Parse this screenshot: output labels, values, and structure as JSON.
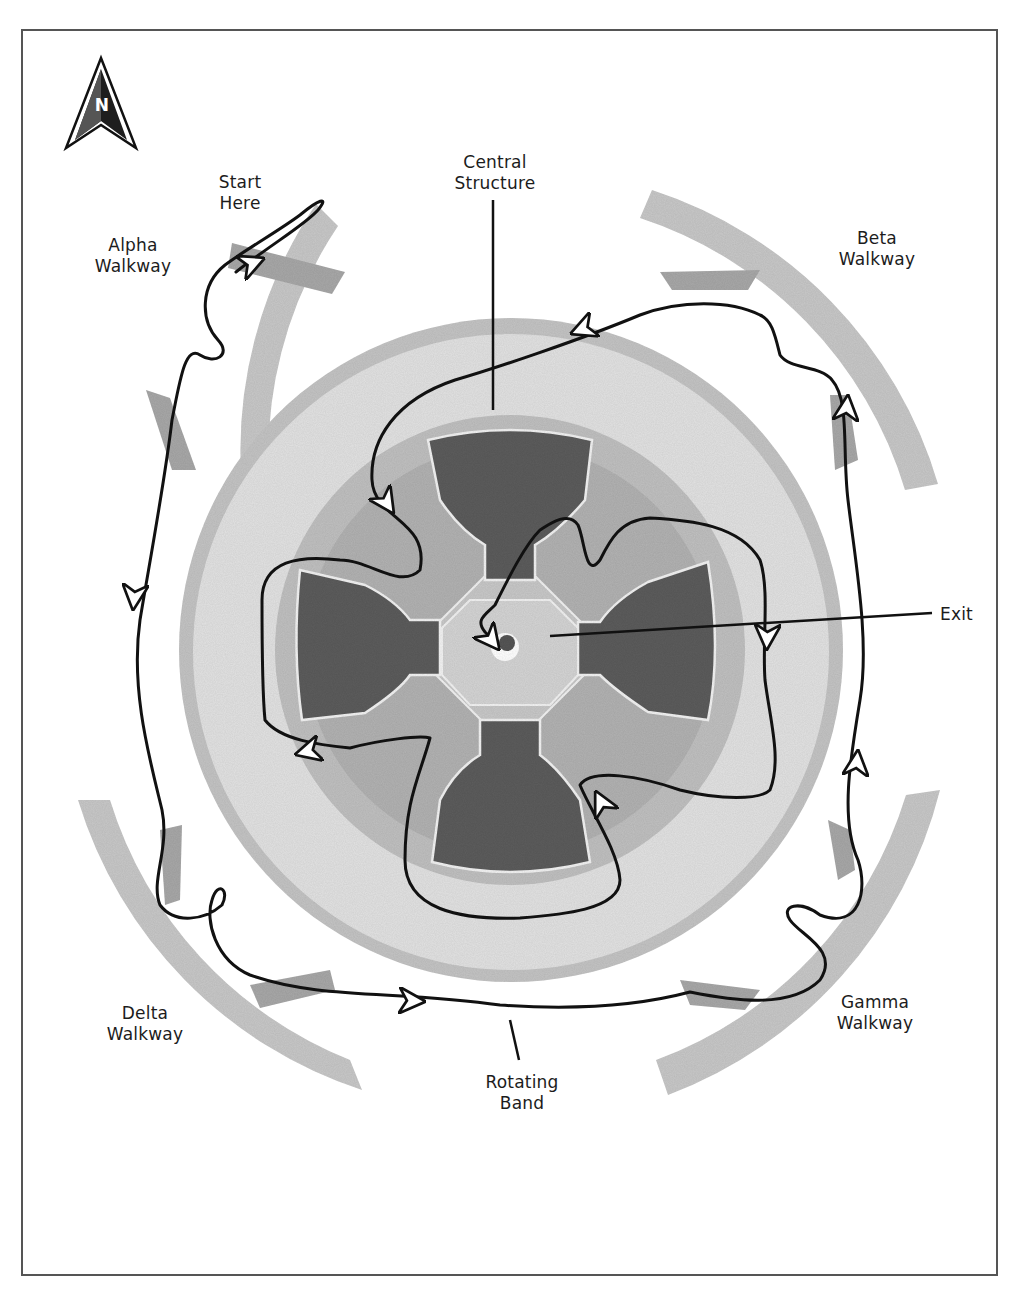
{
  "map": {
    "title_elements": {
      "compass": {
        "icon": "north-arrow-icon",
        "letter": "N"
      }
    },
    "labels": {
      "start": [
        "Start",
        "Here"
      ],
      "central_structure": [
        "Central",
        "Structure"
      ],
      "alpha_walkway": [
        "Alpha",
        "Walkway"
      ],
      "beta_walkway": [
        "Beta",
        "Walkway"
      ],
      "gamma_walkway": [
        "Gamma",
        "Walkway"
      ],
      "delta_walkway": [
        "Delta",
        "Walkway"
      ],
      "rotating_band": [
        "Rotating",
        "Band"
      ],
      "exit": "Exit"
    },
    "colors": {
      "background": "#ffffff",
      "frame": "#555555",
      "walkway": "#c8c8c8",
      "walkway_shadow": "#a8a8a8",
      "rotating_band": "#e2e2e2",
      "band_edge": "#c4c4c4",
      "inner_ring": "#b6b6b6",
      "chamber": "#5c5c5c",
      "chamber_outline": "#f2f2f2",
      "hub": "#cfcfcf",
      "route": "#111111",
      "label_text": "#1c1c1c"
    },
    "regions": [
      "Alpha Walkway",
      "Beta Walkway",
      "Gamma Walkway",
      "Delta Walkway",
      "Rotating Band",
      "Central Structure",
      "Exit"
    ]
  }
}
